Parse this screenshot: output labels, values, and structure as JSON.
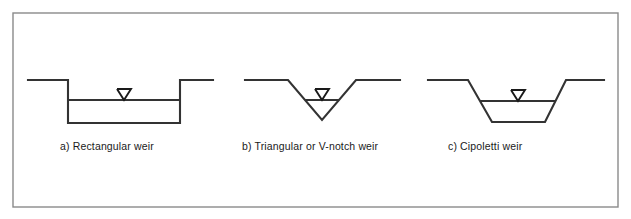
{
  "figure": {
    "background_color": "#ffffff",
    "frame": {
      "stroke_color": "#8a8a8a",
      "x": 13,
      "y": 13,
      "width": 605,
      "height": 194
    },
    "line_color": "#333333",
    "marker_color": "#1a1a1a",
    "text_color": "#1a1a1a"
  },
  "diagrams": [
    {
      "id": "rectangular-weir",
      "label": "a)  Rectangular weir",
      "label_x": 60,
      "label_y": 150,
      "shape": "rectangular notch channel",
      "channel_path": "M 28 80 L 68 80 L 68 123 L 180 123 L 180 80 L 213 80",
      "water_surface": {
        "y": 100,
        "x1": 68,
        "x2": 180
      },
      "marker": {
        "cx": 124,
        "cy": 100,
        "half_width": 7,
        "height": 11
      }
    },
    {
      "id": "triangular-v-notch-weir",
      "label": "b)  Triangular or V-notch weir",
      "label_x": 242,
      "label_y": 150,
      "shape": "V-notch channel",
      "channel_path": "M 245 80 L 288 80 L 322 120 L 356 80 L 400 80",
      "water_surface": {
        "y": 100,
        "x1": 305,
        "x2": 339
      },
      "marker": {
        "cx": 322,
        "cy": 100,
        "half_width": 7,
        "height": 11
      }
    },
    {
      "id": "cipoletti-weir",
      "label": "c)  Cipoletti weir",
      "label_x": 448,
      "label_y": 150,
      "shape": "trapezoidal channel",
      "channel_path": "M 428 80 L 468 80 L 492 122 L 545 122 L 566 80 L 604 80",
      "water_surface": {
        "y": 101,
        "x1": 480,
        "x2": 556
      },
      "marker": {
        "cx": 518,
        "cy": 101,
        "half_width": 7,
        "height": 11
      }
    }
  ]
}
